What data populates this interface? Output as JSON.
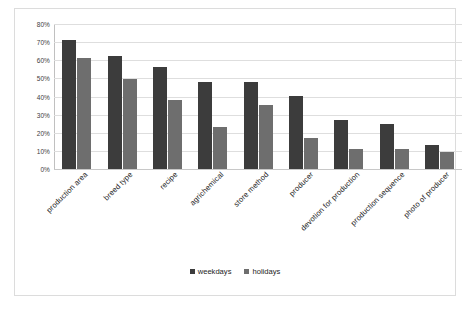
{
  "chart_data": {
    "type": "bar",
    "title": "",
    "xlabel": "",
    "ylabel": "",
    "ylim": [
      0,
      80
    ],
    "ytick_labels": [
      "80%",
      "70%",
      "60%",
      "50%",
      "40%",
      "30%",
      "20%",
      "10%",
      "0%"
    ],
    "ytick_values": [
      80,
      70,
      60,
      50,
      40,
      30,
      20,
      10,
      0
    ],
    "grid": true,
    "legend_position": "bottom",
    "categories": [
      "production area",
      "breed type",
      "recipe",
      "agrichemical",
      "store method",
      "producer",
      "devotion for production",
      "production sequence",
      "photo of producer"
    ],
    "series": [
      {
        "name": "weekdays",
        "color": "#3c3c3c",
        "values": [
          71,
          62.5,
          56.5,
          48,
          48,
          40.5,
          27,
          25,
          13
        ]
      },
      {
        "name": "holidays",
        "color": "#6e6e6e",
        "values": [
          61,
          49.5,
          38,
          23,
          35.5,
          17,
          11,
          11,
          9.5
        ]
      }
    ]
  },
  "legend": {
    "items": [
      {
        "label": "weekdays",
        "color": "#3c3c3c"
      },
      {
        "label": "holidays",
        "color": "#6e6e6e"
      }
    ]
  }
}
